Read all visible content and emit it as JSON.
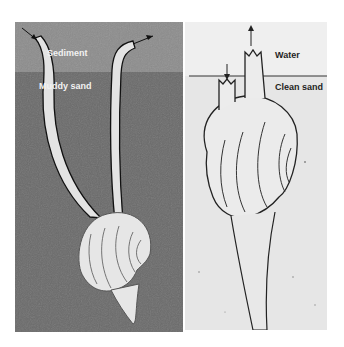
{
  "figure": {
    "left_panel": {
      "layers": [
        {
          "label": "Sediment",
          "color": "#8c8c8c"
        },
        {
          "label": "Muddy sand",
          "color": "#6a6a6a"
        }
      ],
      "organism": "bivalve with two long separated siphons"
    },
    "right_panel": {
      "layers": [
        {
          "label": "Water",
          "color": "#efefef"
        },
        {
          "label": "Clean sand",
          "color": "#e6e6e6"
        }
      ],
      "organism": "bivalve with short fused siphons"
    }
  }
}
